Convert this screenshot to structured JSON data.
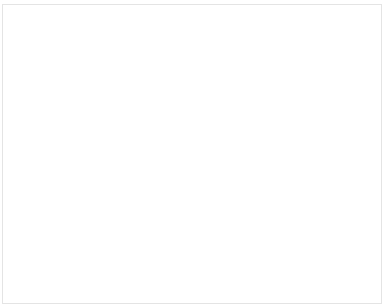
{
  "chart_data": {
    "type": "bar",
    "stacked": true,
    "normalized": true,
    "title": "",
    "xlabel": "",
    "ylabel": "",
    "ylim": [
      0,
      100
    ],
    "yticks": [
      "0%",
      "25%",
      "50%",
      "75%",
      "100%"
    ],
    "legend_position": "right",
    "categories": [
      "110203",
      "110207",
      "110210",
      "110218",
      "110223",
      "110304",
      "110311",
      "110325",
      "110401",
      "110408",
      "110415",
      "110422",
      "110428",
      "110506",
      "110513",
      "110520",
      "110527",
      "110603",
      "110610",
      "110617",
      "110624",
      "110701",
      "110708",
      "110715",
      "110722",
      "110729",
      "110805",
      "110812",
      "110819",
      "計"
    ],
    "series": [
      {
        "name": "音島",
        "color": "#b0b0b0",
        "values": [
          5,
          18,
          35,
          20,
          20,
          19,
          36,
          32,
          31,
          32,
          38,
          38,
          38,
          48,
          45,
          38,
          27,
          35,
          43,
          29,
          30,
          32,
          35,
          29,
          50,
          28,
          33,
          22,
          68,
          32
        ]
      },
      {
        "name": "山田",
        "color": "#f2f2f2",
        "values": [
          20,
          18,
          10,
          20,
          20,
          22,
          18,
          20,
          18,
          22,
          18,
          20,
          18,
          12,
          14,
          18,
          16,
          16,
          14,
          20,
          22,
          16,
          14,
          18,
          12,
          20,
          14,
          20,
          4,
          18
        ]
      },
      {
        "name": "赤木",
        "color": "#e6e6e6",
        "values": [
          10,
          14,
          16,
          10,
          12,
          12,
          8,
          12,
          10,
          8,
          8,
          8,
          10,
          8,
          8,
          10,
          20,
          10,
          8,
          12,
          8,
          12,
          10,
          12,
          6,
          8,
          10,
          14,
          2,
          10
        ]
      },
      {
        "name": "向井",
        "color": "#c4c4c4",
        "values": [
          5,
          6,
          6,
          4,
          5,
          4,
          4,
          4,
          5,
          4,
          4,
          4,
          4,
          3,
          3,
          4,
          4,
          4,
          4,
          4,
          4,
          4,
          4,
          4,
          3,
          4,
          4,
          4,
          2,
          4
        ]
      },
      {
        "name": "平泉",
        "color": "#d8d8d8",
        "values": [
          5,
          4,
          4,
          4,
          5,
          4,
          4,
          4,
          4,
          4,
          4,
          4,
          4,
          3,
          3,
          4,
          3,
          4,
          4,
          4,
          4,
          4,
          4,
          4,
          3,
          4,
          4,
          4,
          2,
          4
        ]
      },
      {
        "name": "田口",
        "color": "#a8a8a8",
        "values": [
          8,
          8,
          6,
          8,
          6,
          6,
          6,
          6,
          6,
          6,
          5,
          5,
          5,
          5,
          5,
          5,
          4,
          5,
          5,
          5,
          5,
          5,
          5,
          5,
          4,
          5,
          5,
          5,
          3,
          5
        ]
      },
      {
        "name": "山内",
        "color": "#ececec",
        "values": [
          5,
          5,
          4,
          6,
          5,
          5,
          4,
          4,
          5,
          4,
          4,
          4,
          4,
          4,
          4,
          4,
          4,
          4,
          4,
          4,
          4,
          4,
          4,
          4,
          4,
          4,
          4,
          4,
          2,
          4
        ]
      },
      {
        "name": "岡田",
        "color": "#6e6e6e",
        "values": [
          6,
          3,
          3,
          3,
          3,
          4,
          3,
          3,
          3,
          3,
          3,
          3,
          3,
          3,
          3,
          3,
          3,
          3,
          3,
          3,
          3,
          3,
          3,
          3,
          3,
          3,
          3,
          3,
          2,
          3
        ]
      },
      {
        "name": "田淳",
        "color": "#f4f4f4",
        "values": [
          4,
          5,
          4,
          6,
          6,
          5,
          4,
          4,
          4,
          4,
          4,
          3,
          3,
          3,
          3,
          4,
          4,
          4,
          3,
          4,
          4,
          4,
          4,
          4,
          3,
          4,
          4,
          4,
          2,
          4
        ]
      },
      {
        "name": "小堀",
        "color": "#bdbdbd",
        "values": [
          4,
          3,
          2,
          4,
          3,
          3,
          2,
          2,
          3,
          2,
          2,
          2,
          2,
          2,
          2,
          2,
          2,
          2,
          2,
          2,
          2,
          2,
          2,
          2,
          2,
          2,
          2,
          2,
          2,
          2
        ]
      },
      {
        "name": "梨元",
        "color": "#eeeeee",
        "values": [
          4,
          4,
          2,
          4,
          4,
          4,
          3,
          2,
          3,
          3,
          2,
          2,
          3,
          2,
          3,
          2,
          3,
          3,
          2,
          3,
          3,
          3,
          3,
          3,
          2,
          3,
          3,
          3,
          2,
          3
        ]
      },
      {
        "name": "坂東",
        "color": "#e0e0e0",
        "values": [
          4,
          3,
          2,
          3,
          3,
          3,
          2,
          2,
          2,
          2,
          2,
          2,
          2,
          2,
          2,
          2,
          2,
          2,
          2,
          2,
          2,
          2,
          2,
          2,
          2,
          2,
          2,
          2,
          2,
          2
        ]
      },
      {
        "name": "有沢",
        "color": "#9a9a9a",
        "values": [
          8,
          4,
          2,
          3,
          3,
          4,
          3,
          2,
          2,
          3,
          3,
          2,
          3,
          2,
          3,
          2,
          3,
          3,
          3,
          3,
          3,
          3,
          3,
          3,
          2,
          3,
          3,
          3,
          3,
          3
        ]
      },
      {
        "name": "大沢",
        "color": "#585858",
        "values": [
          6,
          3,
          2,
          2,
          2,
          2,
          2,
          2,
          2,
          2,
          2,
          2,
          2,
          2,
          2,
          2,
          2,
          2,
          2,
          2,
          2,
          2,
          2,
          2,
          2,
          2,
          2,
          2,
          2,
          2
        ]
      },
      {
        "name": "大嶋",
        "color": "#3e3e3e",
        "values": [
          4,
          3,
          1,
          1,
          1,
          1,
          1,
          2,
          1,
          2,
          1,
          1,
          1,
          1,
          1,
          1,
          1,
          1,
          1,
          1,
          1,
          1,
          1,
          1,
          1,
          1,
          1,
          1,
          1,
          1
        ]
      },
      {
        "name": "榎野",
        "color": "#1e1e1e",
        "values": [
          2,
          1,
          1,
          1,
          1,
          1,
          1,
          1,
          1,
          1,
          1,
          1,
          1,
          1,
          1,
          1,
          1,
          1,
          1,
          1,
          1,
          1,
          1,
          1,
          1,
          1,
          1,
          1,
          1,
          1
        ]
      }
    ]
  }
}
